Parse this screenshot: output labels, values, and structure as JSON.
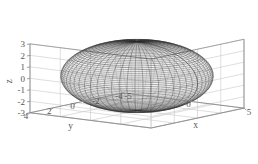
{
  "figure": {
    "type": "3d-surface-plot",
    "background": "#ffffff",
    "width": 258,
    "height": 164
  },
  "chart_data": {
    "type": "scatter",
    "render": "3d-wireframe-mesh-surface",
    "title": "",
    "subtitle": "",
    "surface": {
      "name": "ellipsoid",
      "equation": "x^2/a^2 + y^2/b^2 + z^2/c^2 = 1",
      "semi_axes": {
        "a": 5,
        "b": 4,
        "c": 3
      },
      "center": [
        0,
        0,
        0
      ],
      "mesh_u_lines": 60,
      "mesh_v_lines": 60,
      "edge_color": "#2b2b2b",
      "face_color": "#ffffff"
    },
    "xlabel": "x",
    "ylabel": "y",
    "zlabel": "z",
    "xlim": [
      -5,
      5
    ],
    "ylim": [
      -4,
      4
    ],
    "zlim": [
      -3,
      3
    ],
    "xticks": [
      -5,
      0,
      5
    ],
    "yticks": [
      4,
      2,
      0,
      -2,
      -4
    ],
    "zticks": [
      3,
      2,
      1,
      0,
      -1,
      -2,
      -3
    ],
    "xtick_labels": [
      "-5",
      "0",
      "5"
    ],
    "ytick_labels": [
      "4",
      "2",
      "0",
      "-2",
      "-4"
    ],
    "ztick_labels": [
      "3",
      "2",
      "1",
      "0",
      "-1",
      "-2",
      "-3"
    ],
    "grid": true,
    "grid_color": "#c8c8c8",
    "axis_color": "#8a8a8a",
    "legend": null,
    "view": {
      "azimuth": -37.5,
      "elevation": 20
    }
  },
  "labels": {
    "x_axis_title": "x",
    "y_axis_title": "y",
    "z_axis_title": "z"
  },
  "colors": {
    "mesh": "#2b2b2b",
    "grid": "#c8c8c8",
    "axis": "#8a8a8a",
    "text": "#555555",
    "background": "#ffffff"
  }
}
